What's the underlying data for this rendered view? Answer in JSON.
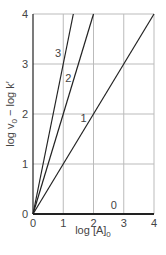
{
  "chart_data": {
    "type": "line",
    "title": "",
    "xlabel": "log [A]₀",
    "ylabel": "log v₀ − log k′",
    "xlim": [
      0,
      4
    ],
    "ylim": [
      0,
      4
    ],
    "x_ticks": [
      "0",
      "1",
      "2",
      "3",
      "4"
    ],
    "y_ticks": [
      "0",
      "1",
      "2",
      "3",
      "4"
    ],
    "grid": true,
    "legend": "inline line labels",
    "series": [
      {
        "name": "0",
        "slope": 0,
        "x": [
          0,
          4
        ],
        "y": [
          0,
          0
        ]
      },
      {
        "name": "1",
        "slope": 1,
        "x": [
          0,
          4
        ],
        "y": [
          0,
          4
        ]
      },
      {
        "name": "2",
        "slope": 2,
        "x": [
          0,
          2
        ],
        "y": [
          0,
          4
        ]
      },
      {
        "name": "3",
        "slope": 3,
        "x": [
          0,
          1.333
        ],
        "y": [
          0,
          4
        ]
      }
    ],
    "line_labels": [
      {
        "text": "3",
        "x": 0.83,
        "y": 3.14
      },
      {
        "text": "2",
        "x": 1.17,
        "y": 2.64
      },
      {
        "text": "1",
        "x": 1.67,
        "y": 1.84
      },
      {
        "text": "0",
        "x": 2.67,
        "y": 0.1
      }
    ]
  },
  "labels": {
    "xlabel_main": "log [A]",
    "xlabel_sub": "0",
    "ylabel_part1": "log v",
    "ylabel_sub": "0",
    "ylabel_part2": " − log k",
    "ylabel_prime": "′"
  },
  "colors": {
    "grid": "#bbbbbb",
    "axis": "#222222",
    "line": "#222222",
    "text": "#444444"
  }
}
